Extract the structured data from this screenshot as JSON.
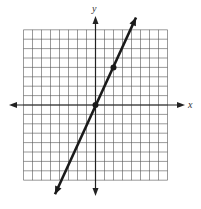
{
  "chart_data": {
    "type": "line",
    "title": "",
    "xlabel": "x",
    "ylabel": "y",
    "xlim": [
      -8,
      8
    ],
    "ylim": [
      -8,
      8
    ],
    "grid": true,
    "grid_step": 1,
    "legend": null,
    "series": [
      {
        "name": "y = 2x",
        "equation": "y = 2x",
        "slope": 2,
        "intercept": 0,
        "x": [
          -4.5,
          4.5
        ],
        "y": [
          -9.5,
          9.3
        ],
        "marked_points": [
          {
            "x": 0,
            "y": 0
          },
          {
            "x": 2,
            "y": 4
          }
        ],
        "arrows_both_ends": true
      }
    ]
  },
  "labels": {
    "x_axis": "x",
    "y_axis": "y"
  },
  "colors": {
    "grid": "#555555",
    "axis": "#222222",
    "line": "#1a1a1a",
    "background": "#ffffff"
  }
}
